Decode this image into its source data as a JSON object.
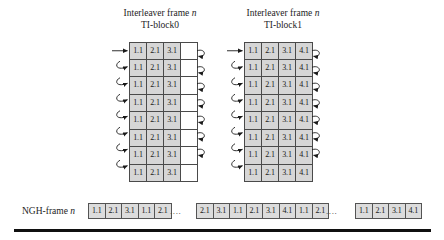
{
  "diagram": {
    "blocks": [
      {
        "id": "ti-block0",
        "title_line1_prefix": "Interleaver frame ",
        "title_line1_italic": "n",
        "title_line2": "TI-block0",
        "rows": 8,
        "row_values": [
          "1.1",
          "2.1",
          "3.1"
        ],
        "empty_cells": 1,
        "input_arrow": true,
        "wrap_arrows": true
      },
      {
        "id": "ti-block1",
        "title_line1_prefix": "Interleaver frame ",
        "title_line1_italic": "n",
        "title_line2": "TI-block1",
        "rows": 8,
        "row_values": [
          "1.1",
          "2.1",
          "3.1",
          "4.1"
        ],
        "empty_cells": 0,
        "input_arrow": true,
        "wrap_arrows": true
      }
    ],
    "ngh_frame": {
      "label_prefix": "NGH-frame ",
      "label_italic": "n",
      "separator": "....",
      "groups": [
        [
          "1.1",
          "2.1",
          "3.1",
          "1.1",
          "2.1"
        ],
        [
          "2.1",
          "3.1",
          "1.1",
          "2.1",
          "3.1",
          "4.1",
          "1.1",
          "2.1"
        ],
        [
          "1.1",
          "2.1",
          "3.1",
          "4.1"
        ]
      ]
    },
    "colors": {
      "cell_fill": "#d6d6d6",
      "cell_empty_fill": "#ffffff",
      "cell_border": "#4a4a4a",
      "ngh_cell_fill": "#dcdcdc",
      "rule": "#101010",
      "text": "#1d1d1d"
    }
  }
}
